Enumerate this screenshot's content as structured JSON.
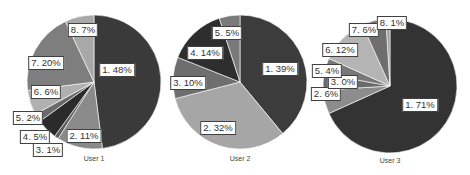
{
  "chart_data": [
    {
      "type": "pie",
      "title": "User 1",
      "center": [
        94,
        82
      ],
      "radius": 67,
      "slices": [
        {
          "label": "1. 48%",
          "category": "1",
          "value": 48,
          "color": "#3a3a3a",
          "label_pos": [
            117,
            70
          ]
        },
        {
          "label": "2. 11%",
          "category": "2",
          "value": 11,
          "color": "#8a8a8a",
          "label_pos": [
            84,
            136
          ]
        },
        {
          "label": "3. 1%",
          "category": "3",
          "value": 1,
          "color": "#5c5c5c",
          "label_pos": [
            48,
            150
          ]
        },
        {
          "label": "4. 5%",
          "category": "4",
          "value": 5,
          "color": "#2b2b2b",
          "label_pos": [
            35,
            137
          ]
        },
        {
          "label": "5. 2%",
          "category": "5",
          "value": 2,
          "color": "#6a6a6a",
          "label_pos": [
            28,
            118
          ]
        },
        {
          "label": "6. 6%",
          "category": "6",
          "value": 6,
          "color": "#b0b0b0",
          "label_pos": [
            46,
            92
          ]
        },
        {
          "label": "7. 20%",
          "category": "7",
          "value": 20,
          "color": "#7e7e7e",
          "label_pos": [
            46,
            63
          ]
        },
        {
          "label": "8. 7%",
          "category": "8",
          "value": 7,
          "color": "#a8a8a8",
          "label_pos": [
            83,
            30
          ]
        }
      ]
    },
    {
      "type": "pie",
      "title": "User 2",
      "center": [
        240,
        82
      ],
      "radius": 67,
      "slices": [
        {
          "label": "1. 39%",
          "category": "1",
          "value": 39,
          "color": "#3c3c3c",
          "label_pos": [
            280,
            69
          ]
        },
        {
          "label": "2. 32%",
          "category": "2",
          "value": 32,
          "color": "#a6a6a6",
          "label_pos": [
            218,
            128
          ]
        },
        {
          "label": "3. 10%",
          "category": "3",
          "value": 10,
          "color": "#6e6e6e",
          "label_pos": [
            188,
            83
          ]
        },
        {
          "label": "4. 14%",
          "category": "4",
          "value": 14,
          "color": "#2e2e2e",
          "label_pos": [
            205,
            53
          ]
        },
        {
          "label": "5. 5%",
          "category": "5",
          "value": 5,
          "color": "#7a7a7a",
          "label_pos": [
            227,
            33
          ]
        }
      ]
    },
    {
      "type": "pie",
      "title": "User 3",
      "center": [
        390,
        86
      ],
      "radius": 67,
      "slices": [
        {
          "label": "1. 71%",
          "category": "1",
          "value": 71,
          "color": "#333333",
          "label_pos": [
            420,
            105
          ]
        },
        {
          "label": "2. 6%",
          "category": "2",
          "value": 6,
          "color": "#8c8c8c",
          "label_pos": [
            326,
            94
          ]
        },
        {
          "label": "3. 0%",
          "category": "3",
          "value": 0,
          "color": "#5a5a5a",
          "label_pos": [
            343,
            82
          ]
        },
        {
          "label": "4. 4%",
          "category": "4",
          "value": 4,
          "color": "#6a6a6a",
          "label_pos": ""
        },
        {
          "label": "5. 4%",
          "category": "5",
          "value": 4,
          "color": "#787878",
          "label_pos": [
            327,
            71
          ]
        },
        {
          "label": "6. 12%",
          "category": "6",
          "value": 12,
          "color": "#b4b4b4",
          "label_pos": [
            340,
            50
          ]
        },
        {
          "label": "7. 6%",
          "category": "7",
          "value": 6,
          "color": "#6e6e6e",
          "label_pos": [
            364,
            30
          ]
        },
        {
          "label": "8. 1%",
          "category": "8",
          "value": 1,
          "color": "#a0a0a0",
          "label_pos": [
            392,
            23
          ]
        }
      ]
    }
  ],
  "titles": [
    "User 1",
    "User 2",
    "User 3"
  ]
}
